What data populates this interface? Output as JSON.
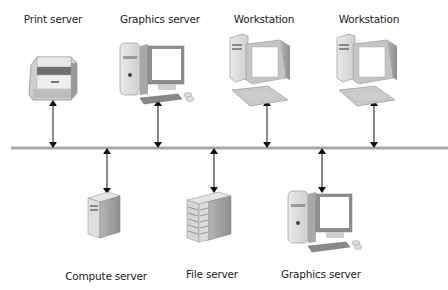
{
  "diagram": {
    "type": "network-bus",
    "bus": {
      "color": "#a8a8a8",
      "y": 148,
      "x_start": 11,
      "x_end": 448
    },
    "top_nodes": [
      {
        "id": "print-server",
        "label": "Print server",
        "icon": "printer-icon",
        "x": 53
      },
      {
        "id": "graphics-server-top",
        "label": "Graphics server",
        "icon": "desktop-tower-monitor-icon",
        "x": 158
      },
      {
        "id": "workstation-1",
        "label": "Workstation",
        "icon": "workstation-icon",
        "x": 268
      },
      {
        "id": "workstation-2",
        "label": "Workstation",
        "icon": "workstation-icon",
        "x": 375
      }
    ],
    "bottom_nodes": [
      {
        "id": "compute-server",
        "label": "Compute server",
        "icon": "tower-server-icon",
        "x": 107
      },
      {
        "id": "file-server",
        "label": "File server",
        "icon": "rack-server-icon",
        "x": 214
      },
      {
        "id": "graphics-server-bottom",
        "label": "Graphics server",
        "icon": "desktop-tower-monitor-icon",
        "x": 322
      }
    ],
    "connector": "bidirectional-arrow"
  }
}
